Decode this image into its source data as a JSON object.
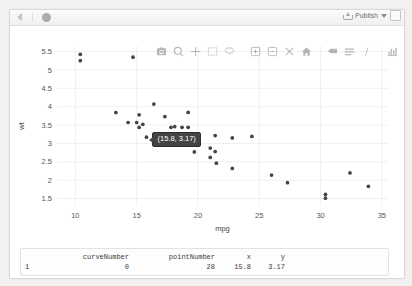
{
  "pane": {
    "name": "rstudio-viewer-pane",
    "toolbar": {
      "back_label": "Back",
      "stop_label": "Stop",
      "publish_label": "Publish",
      "publish_caret_label": "▾",
      "popout_label": "Show in new window"
    },
    "modebar": {
      "buttons": [
        {
          "name": "camera-icon",
          "label": "Download plot as a png"
        },
        {
          "name": "zoom-icon",
          "label": "Zoom"
        },
        {
          "name": "pan-icon",
          "label": "Pan"
        },
        {
          "name": "box-select-icon",
          "label": "Box Select"
        },
        {
          "name": "lasso-select-icon",
          "label": "Lasso Select"
        },
        {
          "name": "zoom-in-icon",
          "label": "Zoom in"
        },
        {
          "name": "zoom-out-icon",
          "label": "Zoom out"
        },
        {
          "name": "autoscale-icon",
          "label": "Autoscale"
        },
        {
          "name": "reset-axes-icon",
          "label": "Reset axes"
        },
        {
          "name": "hover-compare-icon",
          "label": "Toggle Spike Lines"
        },
        {
          "name": "hover-closest-icon",
          "label": "Show closest data on hover"
        },
        {
          "name": "spike-lines-icon",
          "label": "Compare data on hover"
        },
        {
          "name": "plotly-logo-icon",
          "label": "Produced with Plotly"
        }
      ]
    }
  },
  "tooltip": {
    "text": "(15.8, 3.17)",
    "x": 15.8,
    "y": 3.17
  },
  "event_table": {
    "headers": [
      "curveNumber",
      "pointNumber",
      "x",
      "y"
    ],
    "row_index": "1",
    "rows": [
      {
        "index": "1",
        "curveNumber": "0",
        "pointNumber": "28",
        "x": "15.8",
        "y": "3.17"
      }
    ]
  },
  "chart_data": {
    "type": "scatter",
    "title": "",
    "xlabel": "mpg",
    "ylabel": "wt",
    "xlim": [
      8.5,
      35.5
    ],
    "ylim": [
      1.3,
      5.65
    ],
    "xticks": [
      10,
      15,
      20,
      25,
      30,
      35
    ],
    "yticks": [
      1.5,
      2,
      2.5,
      3,
      3.5,
      4,
      4.5,
      5,
      5.5
    ],
    "grid": true,
    "legend": "none",
    "marker_color": "#444444",
    "marker_size": 3,
    "x": [
      21.0,
      21.0,
      22.8,
      21.4,
      18.7,
      18.1,
      14.3,
      24.4,
      22.8,
      19.2,
      17.8,
      16.4,
      17.3,
      15.2,
      10.4,
      10.4,
      14.7,
      32.4,
      30.4,
      33.9,
      21.5,
      15.5,
      15.2,
      13.3,
      19.2,
      27.3,
      26.0,
      30.4,
      15.8,
      19.7,
      15.0,
      21.4
    ],
    "y": [
      2.62,
      2.875,
      2.32,
      3.215,
      3.44,
      3.46,
      3.57,
      3.19,
      3.15,
      3.44,
      3.44,
      4.07,
      3.73,
      3.78,
      5.25,
      5.424,
      5.345,
      2.2,
      1.615,
      1.835,
      2.465,
      3.52,
      3.435,
      3.84,
      3.845,
      1.935,
      2.14,
      1.513,
      3.17,
      2.77,
      3.57,
      2.78
    ],
    "highlighted_point": {
      "pointNumber": 28,
      "x": 15.8,
      "y": 3.17
    }
  }
}
